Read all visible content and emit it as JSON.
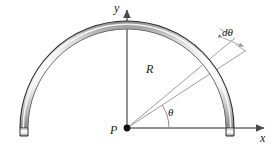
{
  "figure": {
    "background_color": "#ffffff",
    "width": 275,
    "height": 147
  },
  "axes": {
    "origin": {
      "x": 127,
      "y": 128
    },
    "x_axis": {
      "label": "x",
      "color": "#6e6e6e",
      "from": {
        "x": 127,
        "y": 128
      },
      "to": {
        "x": 268,
        "y": 128
      },
      "arrow": "right"
    },
    "y_axis": {
      "label": "y",
      "color": "#6e6e6e",
      "from": {
        "x": 127,
        "y": 128
      },
      "to": {
        "x": 127,
        "y": 6
      },
      "arrow": "up"
    }
  },
  "point": {
    "label": "P",
    "x": 127,
    "y": 128,
    "marker": "filled-dot",
    "color": "#111111",
    "radius": 3.4
  },
  "ring": {
    "type": "semicircular-band",
    "center": {
      "x": 127,
      "y": 128
    },
    "radius_center": 103,
    "band_thickness": 8,
    "start_angle_deg": 0,
    "end_angle_deg": 180,
    "edge_color": "#3a3a3a",
    "fill_gradient": [
      "#ffffff",
      "#f2f2f2",
      "#bfbfbf",
      "#8e8e8e"
    ]
  },
  "radius_line": {
    "label": "R",
    "angle_deg": 33,
    "color": "#9a9a9a",
    "from": {
      "x": 127,
      "y": 128
    },
    "to": {
      "x": 242,
      "y": 53
    }
  },
  "second_radius_line": {
    "angle_deg": 40,
    "color": "#9a9a9a",
    "from": {
      "x": 127,
      "y": 128
    },
    "to": {
      "x": 232,
      "y": 40
    }
  },
  "angle_arc": {
    "label": "θ",
    "vertex": {
      "x": 127,
      "y": 128
    },
    "radius": 42,
    "start_deg": 0,
    "end_deg": 33,
    "color": "#8c8c8c"
  },
  "element_angle": {
    "label": "dθ",
    "color": "#9a9a9a",
    "tick_length": 11,
    "description": "angular element between the two radial lines"
  },
  "labels": {
    "x": "x",
    "y": "y",
    "P": "P",
    "R": "R",
    "theta": "θ",
    "dtheta": "dθ"
  }
}
